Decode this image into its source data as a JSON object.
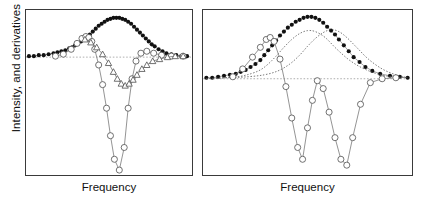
{
  "figure": {
    "ylabel": "Intensity, and derivatives",
    "panels": [
      {
        "id": "left",
        "xlabel": "Frequency"
      },
      {
        "id": "right",
        "xlabel": "Frequency"
      }
    ]
  },
  "colors": {
    "frame": "#3a3a3a",
    "filled_marker": "#111111",
    "open_marker_stroke": "#555555",
    "open_marker_fill": "#ffffff",
    "line": "#777777",
    "baseline_dotted": "#999999",
    "component_dotted": "#555555"
  },
  "chart_data": [
    {
      "type": "line",
      "title": "",
      "xlabel": "Frequency",
      "ylabel": "Intensity, and derivatives",
      "panel": "left",
      "description": "Single resolved absorption peak with its first and second derivatives",
      "xlim": [
        0,
        168
      ],
      "ylim": [
        167,
        0
      ],
      "grid": false,
      "legend": "none",
      "baseline_y": 48,
      "series": [
        {
          "name": "Intensity",
          "marker": "filled-circle",
          "x": [
            3,
            8,
            13,
            18,
            23,
            28,
            32,
            36,
            40,
            44,
            47,
            50,
            53,
            56,
            59,
            62,
            65,
            68,
            71,
            74,
            77,
            80,
            83,
            86,
            89,
            92,
            95,
            98,
            101,
            104,
            107,
            110,
            113,
            116,
            119,
            122,
            125,
            128,
            131,
            135,
            139,
            143,
            148,
            153,
            158,
            164
          ],
          "y": [
            47,
            47,
            46,
            46,
            45,
            44,
            43,
            42,
            41,
            39,
            38,
            36,
            34,
            32,
            30,
            27,
            25,
            22,
            19,
            16,
            14,
            12,
            10,
            9,
            8,
            8,
            8,
            9,
            10,
            12,
            14,
            17,
            20,
            23,
            26,
            29,
            32,
            35,
            37,
            40,
            42,
            44,
            45,
            46,
            47,
            47
          ]
        },
        {
          "name": "First derivative",
          "marker": "open-circle",
          "x": [
            30,
            38,
            46,
            52,
            57,
            61,
            64,
            67,
            70,
            74,
            78,
            82,
            86,
            90,
            95,
            100,
            104,
            108,
            112,
            117,
            123,
            130,
            138,
            148,
            160
          ],
          "y": [
            47,
            45,
            40,
            34,
            29,
            27,
            28,
            32,
            40,
            56,
            76,
            100,
            128,
            152,
            163,
            140,
            100,
            70,
            52,
            44,
            42,
            44,
            46,
            47,
            47
          ]
        },
        {
          "name": "Second derivative",
          "marker": "open-triangle",
          "x": [
            60,
            66,
            72,
            78,
            84,
            89,
            93,
            97,
            101,
            105,
            109,
            113,
            118,
            123,
            129,
            136,
            144,
            152,
            160
          ],
          "y": [
            30,
            33,
            38,
            45,
            54,
            63,
            70,
            75,
            77,
            75,
            71,
            66,
            60,
            56,
            52,
            50,
            48,
            47,
            47
          ]
        }
      ]
    },
    {
      "type": "line",
      "title": "",
      "xlabel": "Frequency",
      "ylabel": "Intensity, and derivatives",
      "panel": "right",
      "description": "Two overlapping unresolved peaks; dotted lines show the individual components, filled circles the summed envelope, open circles the oscillating derivative",
      "xlim": [
        0,
        211
      ],
      "ylim": [
        167,
        0
      ],
      "grid": false,
      "legend": "none",
      "baseline_y": 70,
      "series": [
        {
          "name": "Intensity envelope",
          "marker": "filled-circle",
          "x": [
            3,
            9,
            15,
            21,
            27,
            33,
            38,
            43,
            48,
            53,
            58,
            62,
            66,
            70,
            74,
            78,
            82,
            86,
            90,
            94,
            98,
            102,
            106,
            110,
            114,
            118,
            122,
            126,
            130,
            134,
            138,
            143,
            148,
            153,
            159,
            165,
            172,
            180,
            190,
            200,
            208
          ],
          "y": [
            69,
            69,
            68,
            67,
            66,
            65,
            63,
            61,
            58,
            55,
            51,
            46,
            41,
            36,
            31,
            26,
            22,
            18,
            15,
            12,
            10,
            8,
            7,
            7,
            8,
            10,
            13,
            17,
            21,
            25,
            30,
            36,
            42,
            48,
            53,
            58,
            62,
            65,
            67,
            68,
            69
          ]
        },
        {
          "name": "Component peak 1",
          "marker": "none",
          "style": "dotted",
          "x": [
            3,
            20,
            35,
            48,
            58,
            66,
            74,
            82,
            90,
            98,
            106,
            114,
            124,
            136,
            150,
            166,
            185,
            208
          ],
          "y": [
            70,
            69,
            68,
            65,
            61,
            55,
            47,
            38,
            30,
            24,
            21,
            22,
            28,
            40,
            52,
            61,
            67,
            69
          ]
        },
        {
          "name": "Component peak 2",
          "marker": "none",
          "style": "dotted",
          "x": [
            3,
            25,
            45,
            62,
            76,
            88,
            98,
            106,
            114,
            122,
            130,
            138,
            146,
            156,
            168,
            182,
            196,
            208
          ],
          "y": [
            70,
            69,
            68,
            66,
            62,
            55,
            46,
            37,
            29,
            23,
            20,
            22,
            28,
            38,
            50,
            60,
            66,
            69
          ]
        },
        {
          "name": "Derivative",
          "marker": "open-circle",
          "x": [
            30,
            40,
            50,
            58,
            64,
            68,
            72,
            78,
            84,
            90,
            96,
            101,
            106,
            111,
            116,
            122,
            128,
            134,
            140,
            146,
            152,
            160,
            170,
            182,
            196
          ],
          "y": [
            68,
            60,
            48,
            38,
            30,
            28,
            32,
            50,
            78,
            110,
            140,
            152,
            120,
            92,
            72,
            80,
            104,
            130,
            152,
            158,
            130,
            96,
            74,
            70,
            69
          ]
        }
      ]
    }
  ]
}
